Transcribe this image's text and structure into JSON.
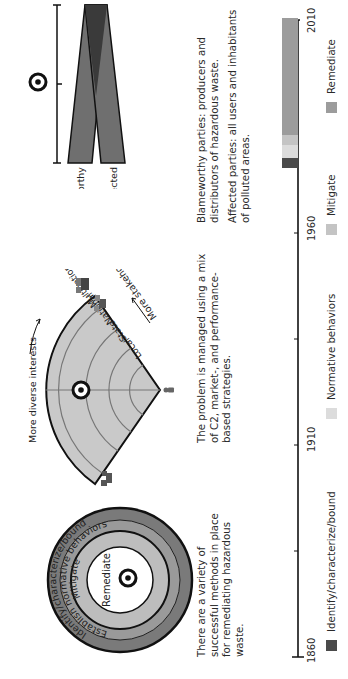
{
  "figure": {
    "orientation": "rotated-90-ccw",
    "panels": {
      "onion": {
        "rings": [
          {
            "label": "Identify/characterize/bound",
            "color": "#7a7a7a"
          },
          {
            "label": "Establish normative behaviors",
            "color": "#9a9a9a"
          },
          {
            "label": "Mitigate",
            "color": "#bdbdbd"
          },
          {
            "label": "Remediate",
            "color": "#ffffff"
          }
        ],
        "marker": "target-icon",
        "caption": [
          "There are a variety of",
          "successful methods in place",
          "for remediating hazardous",
          "waste."
        ]
      },
      "fan": {
        "top_label": "More diverse interests",
        "side_label": "More stakeholders",
        "levels": [
          "Local",
          "State",
          "National",
          "Multinational"
        ],
        "fill": "#c9c9c9",
        "marker": "target-icon",
        "caption": [
          "The problem is managed using a mix",
          "of C2, market-, and performance-",
          "based strategies."
        ]
      },
      "parties": {
        "bars": [
          {
            "label": "Blameworthy",
            "color": "#6f6f6f"
          },
          {
            "label": "Affected",
            "color": "#6f6f6f"
          }
        ],
        "overlap_color": "#3a3a3a",
        "marker": "target-icon",
        "caption_blameworthy": [
          "Blameworthy parties: producers and",
          "distributors of hazardous waste."
        ],
        "caption_affected": [
          "Affected parties: all users and inhabitants",
          "of polluted areas."
        ]
      }
    },
    "timeline": {
      "axis_labels": [
        "1860",
        "1910",
        "1960",
        "2010"
      ],
      "axis_min": 1860,
      "axis_max": 2010,
      "minor_ticks": [
        1885,
        1935,
        1985
      ],
      "segments": [
        {
          "label": "Identify/characterize/bound",
          "start": 1972,
          "end": 1976,
          "color": "#4a4a4a"
        },
        {
          "label": "Normative behaviors",
          "start": 1976,
          "end": 1979,
          "color": "#dcdcdc"
        },
        {
          "label": "Mitigate",
          "start": 1979,
          "end": 1983,
          "color": "#c4c4c4"
        },
        {
          "label": "Remediate",
          "start": 1983,
          "end": 2010,
          "color": "#9c9c9c"
        }
      ],
      "legend": [
        {
          "label": "Identify/characterize/bound",
          "color": "#4a4a4a"
        },
        {
          "label": "Normative behaviors",
          "color": "#dcdcdc"
        },
        {
          "label": "Mitigate",
          "color": "#c4c4c4"
        },
        {
          "label": "Remediate",
          "color": "#9c9c9c"
        }
      ]
    }
  }
}
